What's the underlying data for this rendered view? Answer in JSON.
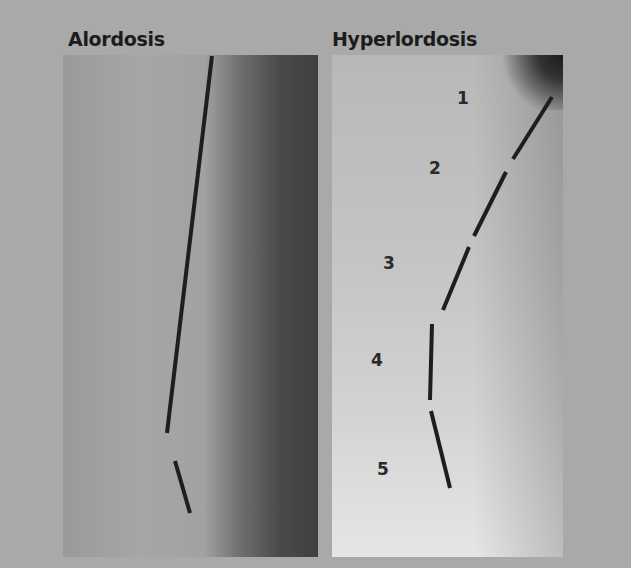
{
  "figure": {
    "panels": [
      {
        "title": "Alordosis"
      },
      {
        "title": "Hyperlordosis",
        "vertebra_labels": [
          "1",
          "2",
          "3",
          "4",
          "5"
        ]
      }
    ]
  }
}
